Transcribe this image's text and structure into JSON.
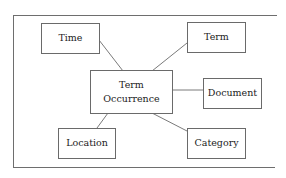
{
  "diagram": {
    "type": "star-schema",
    "center": {
      "id": "term_occurrence",
      "line1": "Term",
      "line2": "Occurrence"
    },
    "nodes": [
      {
        "id": "time",
        "label": "Time"
      },
      {
        "id": "term",
        "label": "Term"
      },
      {
        "id": "document",
        "label": "Document"
      },
      {
        "id": "location",
        "label": "Location"
      },
      {
        "id": "category",
        "label": "Category"
      }
    ],
    "edges": [
      {
        "from": "term_occurrence",
        "to": "time"
      },
      {
        "from": "term_occurrence",
        "to": "term"
      },
      {
        "from": "term_occurrence",
        "to": "document"
      },
      {
        "from": "term_occurrence",
        "to": "location"
      },
      {
        "from": "term_occurrence",
        "to": "category"
      }
    ],
    "colors": {
      "border": "#6a6a6a",
      "line": "#7a7a7a",
      "background": "#ffffff",
      "text": "#222222"
    }
  }
}
